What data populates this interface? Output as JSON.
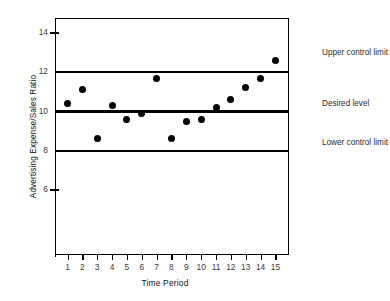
{
  "chart_data": {
    "type": "scatter",
    "title": "",
    "xlabel": "Time Period",
    "ylabel": "Advertising Expense/Sales Ratio",
    "x": [
      1,
      2,
      3,
      4,
      5,
      6,
      7,
      8,
      9,
      10,
      11,
      12,
      13,
      14,
      15
    ],
    "values": [
      10.4,
      11.1,
      8.6,
      10.3,
      9.6,
      9.9,
      11.7,
      8.6,
      9.5,
      9.6,
      10.2,
      10.6,
      11.2,
      11.7,
      12.6
    ],
    "xlim": [
      0,
      15.6
    ],
    "ylim": [
      4.6,
      14.9
    ],
    "xticks": [
      "1",
      "2",
      "3",
      "4",
      "5",
      "6",
      "7",
      "8",
      "9",
      "10",
      "11",
      "12",
      "13",
      "14",
      "15"
    ],
    "yticks": [
      "6",
      "8",
      "10",
      "12",
      "14"
    ],
    "ytick_values": [
      6,
      8,
      10,
      12,
      14
    ],
    "grid": false,
    "legend_position": "right-outside",
    "marker": "filled-circle",
    "marker_color": "#000000",
    "reference_lines": [
      {
        "name": "upper-control-limit",
        "label": "Upper control limit",
        "value": 12,
        "color": "#000000"
      },
      {
        "name": "desired-level",
        "label": "Desired level",
        "value": 10,
        "color": "#000000"
      },
      {
        "name": "lower-control-limit",
        "label": "Lower control limit",
        "value": 8,
        "color": "#000000"
      }
    ]
  },
  "annotations": {
    "upper": "Upper control limit",
    "desired": "Desired level",
    "lower": "Lower control limit"
  }
}
